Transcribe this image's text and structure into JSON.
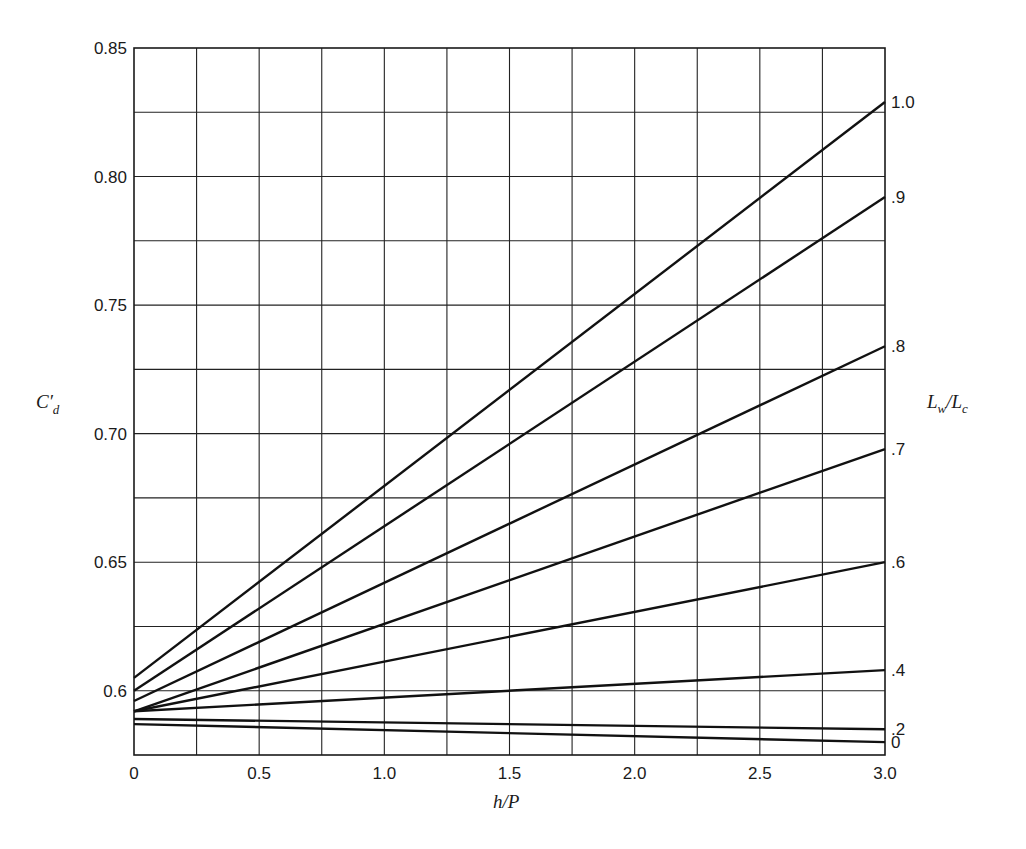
{
  "chart_data": {
    "type": "line",
    "title": "",
    "xlabel": "h/P",
    "ylabel": "C'd",
    "ylabel_parts": {
      "main": "C",
      "prime": "′",
      "sub": "d"
    },
    "right_label": "Lw/Lc",
    "right_label_parts": {
      "a": "L",
      "a_sub": "w",
      "slash": "/",
      "b": "L",
      "b_sub": "c"
    },
    "xlim": [
      0,
      3.0
    ],
    "ylim": [
      0.575,
      0.85
    ],
    "x_ticks": [
      0,
      0.5,
      1.0,
      1.5,
      2.0,
      2.5,
      3.0
    ],
    "x_tick_labels": [
      "0",
      "0.5",
      "1.0",
      "1.5",
      "2.0",
      "2.5",
      "3.0"
    ],
    "y_ticks": [
      0.6,
      0.65,
      0.7,
      0.75,
      0.8,
      0.85
    ],
    "y_tick_labels": [
      "0.6",
      "0.65",
      "0.70",
      "0.75",
      "0.80",
      "0.85"
    ],
    "grid": true,
    "grid_x_step": 0.25,
    "grid_y_step": 0.025,
    "legend_position": "right (inline labels at line ends)",
    "x": [
      0,
      3.0
    ],
    "series": [
      {
        "name": "1.0",
        "label": "1.0",
        "values": [
          0.605,
          0.829
        ]
      },
      {
        "name": "0.9",
        "label": ".9",
        "values": [
          0.6,
          0.792
        ]
      },
      {
        "name": "0.8",
        "label": ".8",
        "values": [
          0.596,
          0.734
        ]
      },
      {
        "name": "0.7",
        "label": ".7",
        "values": [
          0.592,
          0.694
        ]
      },
      {
        "name": "0.6",
        "label": ".6",
        "values": [
          0.592,
          0.65
        ]
      },
      {
        "name": "0.4",
        "label": ".4",
        "values": [
          0.592,
          0.608
        ]
      },
      {
        "name": "0.2",
        "label": ".2",
        "values": [
          0.589,
          0.585
        ]
      },
      {
        "name": "0",
        "label": "0",
        "values": [
          0.587,
          0.58
        ]
      }
    ],
    "colors": {
      "line": "#111111",
      "grid": "#222222",
      "background": "#ffffff"
    }
  }
}
